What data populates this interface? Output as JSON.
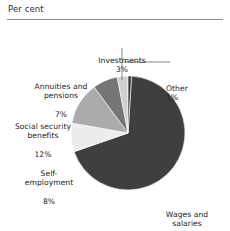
{
  "header": {
    "title": "Per cent"
  },
  "chart_data": {
    "type": "pie",
    "title": "Per cent",
    "unit": "per cent",
    "legend_position": "callout-labels",
    "grid": false,
    "categories": [
      "Wages and salaries",
      "Other",
      "Investments",
      "Annuities and pensions",
      "Social security benefits",
      "Self-employment"
    ],
    "values": [
      68,
      1,
      3,
      7,
      12,
      8
    ],
    "colors": [
      "#3f3f3f",
      "#3f3f3f",
      "#cfcfcf",
      "#767676",
      "#ababab",
      "#ededed"
    ],
    "slices": [
      {
        "name": "wages-and-salaries",
        "label_line1": "Wages and",
        "label_line2": "salaries",
        "percent_label": "68%",
        "value": 68,
        "color": "#3f3f3f",
        "leader": false
      },
      {
        "name": "other",
        "label_line1": "Other",
        "label_line2": "",
        "percent_label": "1%",
        "value": 1,
        "color": "#3f3f3f",
        "leader": true
      },
      {
        "name": "investments",
        "label_line1": "Investments",
        "label_line2": "",
        "percent_label": "3%",
        "value": 3,
        "color": "#cfcfcf",
        "leader": true
      },
      {
        "name": "annuities-and-pensions",
        "label_line1": "Annuities and",
        "label_line2": "pensions",
        "percent_label": "7%",
        "value": 7,
        "color": "#767676",
        "leader": false
      },
      {
        "name": "social-security-benefits",
        "label_line1": "Social security",
        "label_line2": "benefits",
        "percent_label": "12%",
        "value": 12,
        "color": "#ababab",
        "leader": false
      },
      {
        "name": "self-employment",
        "label_line1": "Self-",
        "label_line2": "employment",
        "percent_label": "8%",
        "value": 8,
        "color": "#ededed",
        "leader": false
      }
    ]
  }
}
